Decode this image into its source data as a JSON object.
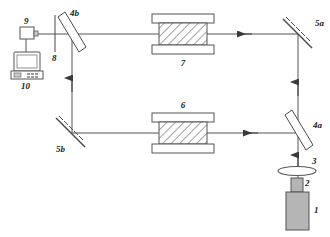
{
  "figure": {
    "type": "optical-interferometer-schematic",
    "background": "#ffffff",
    "line_color": "#4a4a4a",
    "hatch_color": "#555555",
    "laser_fill": "#b0b0b0",
    "plate_fill": "#ffffff"
  },
  "labels": {
    "laser": "1",
    "laser_neck": "2",
    "lens": "3",
    "beamsplitter_lower": "4a",
    "beamsplitter_upper": "4b",
    "mirror_upper": "5a",
    "mirror_lower": "5b",
    "sample_lower": "6",
    "sample_upper": "7",
    "polarizer": "8",
    "detector": "9",
    "computer": "10"
  },
  "components": [
    {
      "id": "1",
      "name": "laser-source"
    },
    {
      "id": "2",
      "name": "laser-output-neck"
    },
    {
      "id": "3",
      "name": "lens"
    },
    {
      "id": "4a",
      "name": "beam-splitter-lower"
    },
    {
      "id": "4b",
      "name": "beam-splitter-upper"
    },
    {
      "id": "5a",
      "name": "mirror-upper-right"
    },
    {
      "id": "5b",
      "name": "mirror-lower-left"
    },
    {
      "id": "6",
      "name": "sample-cell-lower"
    },
    {
      "id": "7",
      "name": "sample-cell-upper"
    },
    {
      "id": "8",
      "name": "aperture-polarizer"
    },
    {
      "id": "9",
      "name": "photodetector"
    },
    {
      "id": "10",
      "name": "computer"
    }
  ]
}
